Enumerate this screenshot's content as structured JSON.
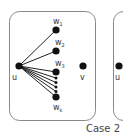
{
  "diagram": {
    "caption": "Case 2",
    "colors": {
      "node": "#111111",
      "edge": "#222222",
      "box": "#888888",
      "text": "#333333"
    },
    "left_panel": {
      "nodes": {
        "u": {
          "label": "u"
        },
        "w1": {
          "label": "w",
          "sub": "1"
        },
        "w2": {
          "label": "w",
          "sub": "2"
        },
        "w3": {
          "label": "w",
          "sub": "3"
        },
        "wk": {
          "label": "w",
          "sub": "k"
        },
        "v": {
          "label": "v"
        }
      }
    },
    "right_panel": {
      "nodes": {
        "u": {
          "label": "u"
        }
      }
    }
  }
}
